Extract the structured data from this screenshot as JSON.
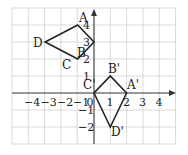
{
  "diagram": {
    "type": "coordinate-plane-transformation",
    "x_range": [
      -5,
      5
    ],
    "y_range": [
      -3,
      5
    ],
    "x_ticks": [
      "−4",
      "−3",
      "−2",
      "−1",
      "0",
      "1",
      "2",
      "3",
      "4"
    ],
    "y_ticks_positive": [
      "1",
      "2",
      "3",
      "4"
    ],
    "y_ticks_negative": [
      "−1",
      "−2"
    ],
    "colors": {
      "grid": "#cfcfcf",
      "axis": "#333333",
      "shape": "#222222"
    },
    "original": {
      "name": "ABCD",
      "vertices": [
        {
          "label": "A",
          "x": -1,
          "y": 4
        },
        {
          "label": "B",
          "x": 0,
          "y": 3
        },
        {
          "label": "C",
          "x": -1,
          "y": 2
        },
        {
          "label": "D",
          "x": -3,
          "y": 3
        }
      ]
    },
    "image": {
      "name": "A'B'C'D'",
      "vertices": [
        {
          "label": "A'",
          "x": 2,
          "y": 0
        },
        {
          "label": "B'",
          "x": 1,
          "y": 1
        },
        {
          "label": "C'",
          "x": 0,
          "y": 0
        },
        {
          "label": "D'",
          "x": 1,
          "y": -2
        }
      ]
    }
  }
}
